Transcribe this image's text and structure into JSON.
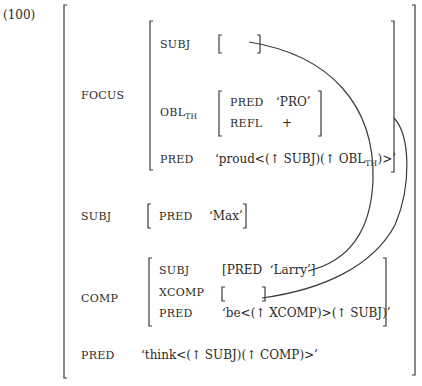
{
  "example_number": "(100)",
  "outer": {
    "focus": {
      "label": "FOCUS",
      "subj": {
        "attr": "SUBJ",
        "value": "[ ]"
      },
      "obl": {
        "attr": "OBL",
        "attr_sub": "TH",
        "pred_attr": "PRED",
        "pred_value": "‘PRO’",
        "refl_attr": "REFL",
        "refl_value": "+"
      },
      "pred": {
        "attr": "PRED",
        "value_pre": "‘proud<(↑ SUBJ)(↑ OBL",
        "value_sub": "TH",
        "value_post": ")>’"
      }
    },
    "subj": {
      "label": "SUBJ",
      "pred_attr": "PRED",
      "pred_value": "‘Max’"
    },
    "comp": {
      "label": "COMP",
      "subj_attr": "SUBJ",
      "subj_value": "[PRED  ‘Larry’]",
      "xcomp_attr": "XCOMP",
      "xcomp_value": "[ ]",
      "pred_attr": "PRED",
      "pred_value": "‘be<(↑ XCOMP)>(↑ SUBJ)’"
    },
    "pred": {
      "label": "PRED",
      "value": "‘think<(↑ SUBJ)(↑ COMP)>’"
    }
  }
}
